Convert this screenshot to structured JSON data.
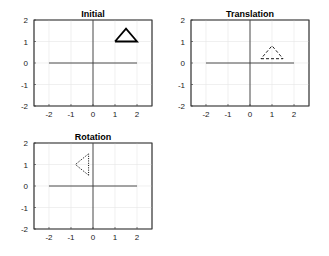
{
  "chart_data": [
    {
      "type": "line",
      "title": "Initial",
      "xlabel": "",
      "ylabel": "",
      "xlim": [
        -2.68,
        2.68
      ],
      "ylim": [
        -2,
        2
      ],
      "xticks": [
        -2,
        -1,
        0,
        1,
        2
      ],
      "yticks": [
        -2,
        -1,
        0,
        1,
        2
      ],
      "grid": true,
      "series": [
        {
          "name": "x-axis-line",
          "x": [
            -2,
            2
          ],
          "y": [
            0,
            0
          ],
          "style": "solid",
          "color": "#3a3a3a",
          "width": 0.9
        },
        {
          "name": "y-axis-line",
          "x": [
            0,
            0
          ],
          "y": [
            -2,
            2
          ],
          "style": "solid",
          "color": "#3a3a3a",
          "width": 0.9
        },
        {
          "name": "triangle",
          "x": [
            1,
            2,
            1.5,
            1
          ],
          "y": [
            1,
            1,
            1.6,
            1
          ],
          "style": "solid",
          "color": "#000000",
          "width": 1.8
        }
      ],
      "box": {
        "left": 34,
        "top": 20,
        "width": 118,
        "height": 86
      }
    },
    {
      "type": "line",
      "title": "Translation",
      "xlabel": "",
      "ylabel": "",
      "xlim": [
        -2.68,
        2.68
      ],
      "ylim": [
        -2,
        2
      ],
      "xticks": [
        -2,
        -1,
        0,
        1,
        2
      ],
      "yticks": [
        -2,
        -1,
        0,
        1,
        2
      ],
      "grid": true,
      "series": [
        {
          "name": "x-axis-line",
          "x": [
            -2,
            2
          ],
          "y": [
            0,
            0
          ],
          "style": "solid",
          "color": "#3a3a3a",
          "width": 0.9
        },
        {
          "name": "y-axis-line",
          "x": [
            0,
            0
          ],
          "y": [
            -2,
            2
          ],
          "style": "solid",
          "color": "#3a3a3a",
          "width": 0.9
        },
        {
          "name": "triangle",
          "x": [
            0.5,
            1.5,
            1,
            0.5
          ],
          "y": [
            0.2,
            0.2,
            0.8,
            0.2
          ],
          "style": "dashed",
          "color": "#000000",
          "width": 0.9
        }
      ],
      "box": {
        "left": 191,
        "top": 20,
        "width": 118,
        "height": 86
      }
    },
    {
      "type": "line",
      "title": "Rotation",
      "xlabel": "",
      "ylabel": "",
      "xlim": [
        -2.68,
        2.68
      ],
      "ylim": [
        -2,
        2
      ],
      "xticks": [
        -2,
        -1,
        0,
        1,
        2
      ],
      "yticks": [
        -2,
        -1,
        0,
        1,
        2
      ],
      "grid": true,
      "series": [
        {
          "name": "x-axis-line",
          "x": [
            -2,
            2
          ],
          "y": [
            0,
            0
          ],
          "style": "solid",
          "color": "#3a3a3a",
          "width": 0.9
        },
        {
          "name": "y-axis-line",
          "x": [
            0,
            0
          ],
          "y": [
            -2,
            2
          ],
          "style": "solid",
          "color": "#3a3a3a",
          "width": 0.9
        },
        {
          "name": "triangle",
          "x": [
            -0.2,
            -0.2,
            -0.8,
            -0.2
          ],
          "y": [
            0.5,
            1.5,
            1.0,
            0.5
          ],
          "style": "dotted",
          "color": "#000000",
          "width": 1.0
        }
      ],
      "box": {
        "left": 34,
        "top": 143,
        "width": 118,
        "height": 86
      }
    }
  ]
}
